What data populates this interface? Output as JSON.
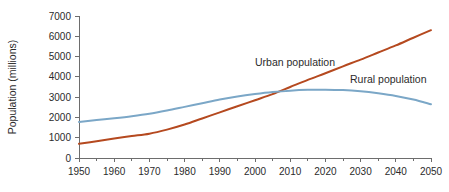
{
  "chart_data": {
    "type": "line",
    "title": "",
    "xlabel": "",
    "ylabel": "Population (millions)",
    "xlim": [
      1950,
      2050
    ],
    "ylim": [
      0,
      7000
    ],
    "grid": false,
    "legend_position": "inline-annotations",
    "background_color": "#ffffff",
    "axis_color": "#6d6d6d",
    "x_ticks": [
      1950,
      1960,
      1970,
      1980,
      1990,
      2000,
      2010,
      2020,
      2030,
      2040,
      2050
    ],
    "x_tick_labels": [
      "1950",
      "1960",
      "1970",
      "1980",
      "1990",
      "2000",
      "2010",
      "2020",
      "2030",
      "2040",
      "2050"
    ],
    "x_minor_ticks": [
      1955,
      1965,
      1975,
      1985,
      1995,
      2005,
      2015,
      2025,
      2035,
      2045
    ],
    "y_ticks": [
      0,
      1000,
      2000,
      3000,
      4000,
      5000,
      6000,
      7000
    ],
    "y_tick_labels": [
      "0",
      "1000",
      "2000",
      "3000",
      "4000",
      "5000",
      "6000",
      "7000"
    ],
    "x": [
      1950,
      1955,
      1960,
      1965,
      1970,
      1975,
      1980,
      1985,
      1990,
      1995,
      2000,
      2005,
      2010,
      2015,
      2020,
      2025,
      2030,
      2035,
      2040,
      2045,
      2050
    ],
    "series": [
      {
        "name": "Urban population",
        "color": "#b5491f",
        "annotation": "Urban population",
        "annotation_x": 2000,
        "annotation_y": 4550,
        "values": [
          700,
          830,
          960,
          1080,
          1200,
          1400,
          1650,
          1950,
          2250,
          2550,
          2850,
          3150,
          3500,
          3850,
          4180,
          4520,
          4850,
          5200,
          5550,
          5930,
          6300
        ]
      },
      {
        "name": "Rural population",
        "color": "#7ba7c7",
        "annotation": "Rural population",
        "annotation_x": 2027,
        "annotation_y": 3680,
        "values": [
          1780,
          1870,
          1960,
          2060,
          2180,
          2340,
          2520,
          2700,
          2880,
          3030,
          3150,
          3250,
          3320,
          3360,
          3370,
          3350,
          3290,
          3190,
          3060,
          2880,
          2650
        ]
      }
    ]
  },
  "chart_meta": {
    "y_axis_title": "Population (millions)"
  }
}
